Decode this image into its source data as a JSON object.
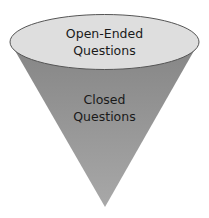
{
  "diagram": {
    "type": "funnel",
    "top_label": [
      "Open-Ended",
      "Questions"
    ],
    "body_label": [
      "Closed",
      "Questions"
    ],
    "colors": {
      "ellipse_fill": "#dedede",
      "outline": "#555555",
      "cone_top": "#888888",
      "cone_bottom": "#a6a6a6"
    }
  }
}
